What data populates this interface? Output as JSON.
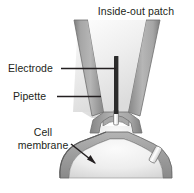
{
  "figure": {
    "title": "Inside-out patch",
    "background_color": "#ffffff",
    "text_color": "#231f20"
  },
  "labels": {
    "electrode": "Electrode",
    "pipette": "Pipette",
    "cell_membrane_line1": "Cell",
    "cell_membrane_line2": "membrane"
  },
  "colors": {
    "pipette_wall": "#9a9a9a",
    "pipette_wall_edge": "#6f6f6f",
    "pipette_interior": "#f2f2f2",
    "electrode": "#2b2b2b",
    "membrane": "#9d9d9d",
    "membrane_edge": "#6b6b6b",
    "cytoplasm": "#e3e3e3",
    "channel_protein": "#ffffff",
    "leader_line": "#231f20"
  },
  "parts": [
    "pipette-left-wall",
    "pipette-right-wall",
    "pipette-interior",
    "electrode-bar",
    "membrane-patch",
    "cell-membrane-dome",
    "ion-channel-in-patch",
    "ion-channel-in-membrane"
  ]
}
